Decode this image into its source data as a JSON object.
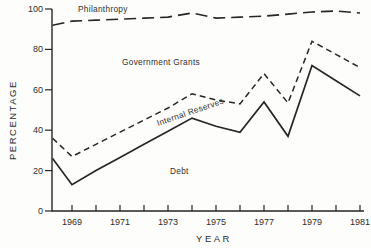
{
  "figure": {
    "background": "#fdfdfb",
    "ink": "#262626"
  },
  "chart_data": {
    "type": "line",
    "title": "",
    "xlabel": "YEAR",
    "ylabel": "PERCENTAGE",
    "xlim": [
      1968,
      1981
    ],
    "ylim": [
      0,
      100
    ],
    "grid": false,
    "legend_position": "inline-region-labels",
    "x": [
      1968,
      1969,
      1970,
      1971,
      1972,
      1973,
      1974,
      1975,
      1976,
      1977,
      1978,
      1979,
      1980,
      1981
    ],
    "x_tick_years": [
      1969,
      1970,
      1971,
      1972,
      1973,
      1974,
      1975,
      1976,
      1977,
      1978,
      1979,
      1980,
      1981
    ],
    "x_labeled_years": [
      1969,
      1971,
      1973,
      1975,
      1977,
      1979,
      1981
    ],
    "y_ticks": [
      0,
      20,
      40,
      60,
      80,
      100
    ],
    "region_labels": [
      "Philanthropy",
      "Government Grants",
      "Internal Reserves",
      "Debt"
    ],
    "series": [
      {
        "name": "philanthropy-upper-boundary",
        "region_above": "Philanthropy",
        "style": "long-dash",
        "values": [
          92,
          94,
          94.5,
          95,
          95.5,
          96,
          98,
          95.5,
          96,
          96.5,
          97.5,
          98.5,
          99,
          98
        ]
      },
      {
        "name": "government-grants-lower-boundary",
        "region_above": "Government Grants",
        "style": "short-dash",
        "values": [
          36,
          27,
          33,
          39,
          45,
          51,
          58,
          55,
          53,
          68,
          53.5,
          84,
          77.5,
          71
        ]
      },
      {
        "name": "internal-reserves-lower-boundary",
        "region_above": "Internal Reserves",
        "region_below": "Debt",
        "style": "solid",
        "values": [
          26,
          13,
          20,
          26.5,
          33,
          39.5,
          46,
          42,
          39,
          54,
          37,
          72,
          64.5,
          57
        ]
      }
    ]
  }
}
